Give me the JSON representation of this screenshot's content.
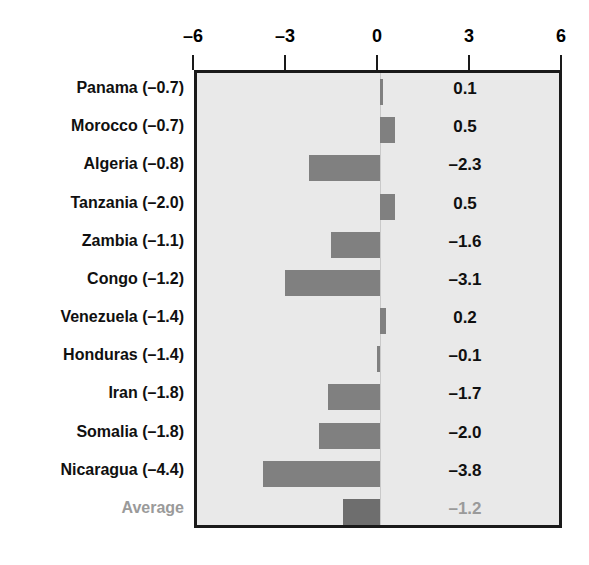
{
  "chart_data": {
    "type": "bar",
    "orientation": "horizontal",
    "title": "",
    "subtitle": "",
    "xlabel": "",
    "ylabel": "",
    "xlim": [
      -6,
      6
    ],
    "xticks": [
      -6,
      -3,
      0,
      3,
      6
    ],
    "xtick_labels": [
      "–6",
      "–3",
      "0",
      "3",
      "6"
    ],
    "grid": false,
    "legend": null,
    "axis_position": "top",
    "categories": [
      "Panama (–0.7)",
      "Morocco (–0.7)",
      "Algeria (–0.8)",
      "Tanzania (–2.0)",
      "Zambia (–1.1)",
      "Congo (–1.2)",
      "Venezuela (–1.4)",
      "Honduras (–1.4)",
      "Iran (–1.8)",
      "Somalia (–1.8)",
      "Nicaragua (–4.4)",
      "Average"
    ],
    "values": [
      0.1,
      0.5,
      -2.3,
      0.5,
      -1.6,
      -3.1,
      0.2,
      -0.1,
      -1.7,
      -2.0,
      -3.8,
      -1.2
    ],
    "value_labels": [
      "0.1",
      "0.5",
      "–2.3",
      "0.5",
      "–1.6",
      "–3.1",
      "0.2",
      "–0.1",
      "–1.7",
      "–2.0",
      "–3.8",
      "–1.2"
    ],
    "baseline_values": [
      -0.7,
      -0.7,
      -0.8,
      -2.0,
      -1.1,
      -1.2,
      -1.4,
      -1.4,
      -1.8,
      -1.8,
      -4.4,
      null
    ],
    "highlight_row_index": 11,
    "colors": {
      "bar": "#808080",
      "average_bar": "#6e6e6e",
      "plot_background": "#e9e9e9",
      "frame": "#1a1a1a",
      "label_text": "#101010",
      "muted_text": "#9a9a9a",
      "zero_line": "#c9c9c9"
    }
  }
}
